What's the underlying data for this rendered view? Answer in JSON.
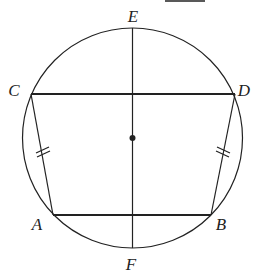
{
  "figure": {
    "type": "geometry-diagram",
    "colors": {
      "stroke": "#222222",
      "background": "#ffffff"
    },
    "circle": {
      "cx": 132.5,
      "cy": 138,
      "r": 110,
      "center_marked": true
    },
    "points": {
      "E": {
        "label": "E",
        "x": 132.5,
        "y": 28,
        "label_x": 133,
        "label_y": 22
      },
      "F": {
        "label": "F",
        "x": 132.5,
        "y": 248,
        "label_x": 131,
        "label_y": 270
      },
      "C": {
        "label": "C",
        "x": 31,
        "y": 94,
        "label_x": 14,
        "label_y": 96
      },
      "D": {
        "label": "D",
        "x": 235,
        "y": 94,
        "label_x": 244,
        "label_y": 96
      },
      "A": {
        "label": "A",
        "x": 53,
        "y": 215,
        "label_x": 37,
        "label_y": 230
      },
      "B": {
        "label": "B",
        "x": 211,
        "y": 215,
        "label_x": 221,
        "label_y": 230
      }
    },
    "segments": [
      {
        "from": "C",
        "to": "D",
        "weight": "bold"
      },
      {
        "from": "A",
        "to": "B",
        "weight": "bold"
      },
      {
        "from": "C",
        "to": "A",
        "weight": "thin",
        "tick_marks": 2
      },
      {
        "from": "D",
        "to": "B",
        "weight": "thin",
        "tick_marks": 2
      },
      {
        "from": "E",
        "to": "F",
        "weight": "thin"
      }
    ],
    "top_fragment_line": {
      "x1": 165,
      "x2": 205,
      "y": 1
    }
  }
}
